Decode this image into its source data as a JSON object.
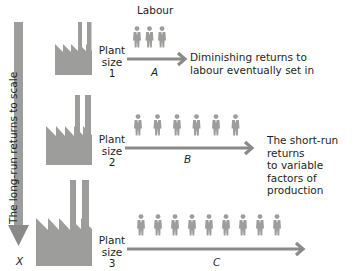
{
  "diagram": {
    "header": {
      "labour_label": "Labour"
    },
    "side_axis": {
      "label": "The long-run returns to scale",
      "end_label": "X"
    },
    "rows": [
      {
        "plant_label": "Plant",
        "size_label": "size",
        "size_number": "1",
        "arrow_label": "A",
        "workers": 3,
        "description_lines": [
          "Diminishing returns to",
          "labour eventually set in"
        ]
      },
      {
        "plant_label": "Plant",
        "size_label": "size",
        "size_number": "2",
        "arrow_label": "B",
        "workers": 6,
        "description_lines": [
          "The short-run returns",
          "to variable factors of",
          "production"
        ]
      },
      {
        "plant_label": "Plant",
        "size_label": "size",
        "size_number": "3",
        "arrow_label": "C",
        "workers": 9,
        "description_lines": []
      }
    ],
    "colors": {
      "graphic_gray": "#9d9d9c",
      "arrow_gray": "#8a8a89",
      "text": "#231f20"
    }
  }
}
